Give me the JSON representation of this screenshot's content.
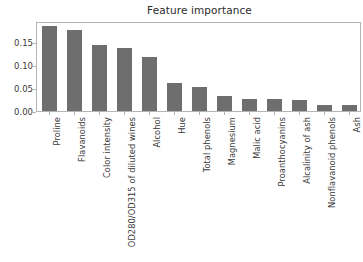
{
  "chart_data": {
    "type": "bar",
    "title": "Feature importance",
    "xlabel": "",
    "ylabel": "",
    "ylim": [
      0.0,
      0.195
    ],
    "yticks": [
      0.0,
      0.05,
      0.1,
      0.15
    ],
    "ytick_labels": [
      "0.00",
      "0.05",
      "0.10",
      "0.15"
    ],
    "grid": false,
    "legend": null,
    "bar_color": "#6e6e6e",
    "axes_color": "#b4b4b4",
    "categories": [
      "Proline",
      "Flavanoids",
      "Color intensity",
      "OD280/OD315 of diluted wines",
      "Alcohol",
      "Hue",
      "Total phenols",
      "Magnesium",
      "Malic acid",
      "Proanthocyanins",
      "Alcalinity of ash",
      "Nonflavanoid phenols",
      "Ash"
    ],
    "values": [
      0.185,
      0.175,
      0.144,
      0.136,
      0.118,
      0.06,
      0.052,
      0.032,
      0.027,
      0.027,
      0.023,
      0.014,
      0.013
    ]
  }
}
